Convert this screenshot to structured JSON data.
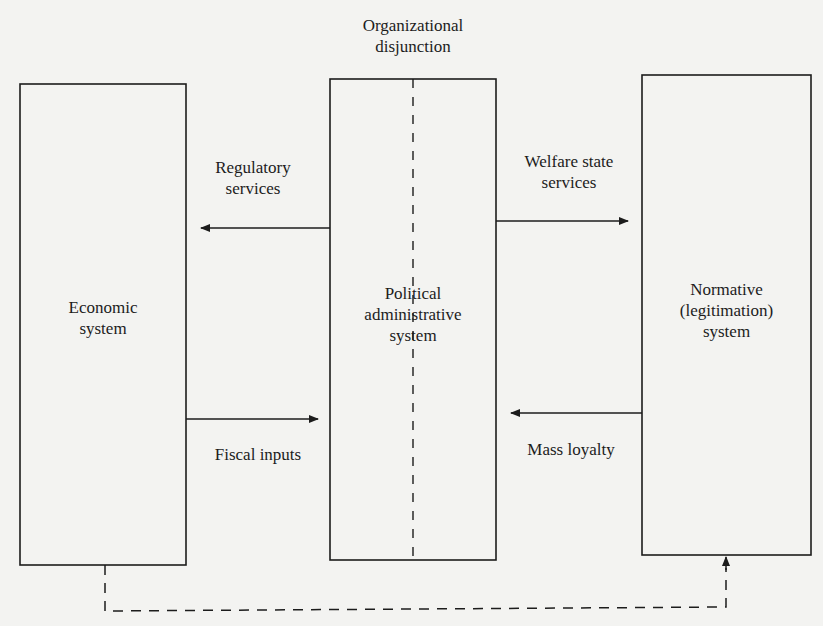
{
  "diagram": {
    "type": "flow",
    "heading": {
      "line1": "Organizational",
      "line2": "disjunction"
    },
    "nodes": [
      {
        "id": "economic",
        "line1": "Economic",
        "line2": "system",
        "line3": ""
      },
      {
        "id": "political",
        "line1": "Political",
        "line2": "administrative",
        "line3": "system"
      },
      {
        "id": "normative",
        "line1": "Normative",
        "line2": "(legitimation)",
        "line3": "system"
      }
    ],
    "edges": [
      {
        "from": "political",
        "to": "economic",
        "line1": "Regulatory",
        "line2": "services"
      },
      {
        "from": "political",
        "to": "normative",
        "line1": "Welfare state",
        "line2": "services"
      },
      {
        "from": "economic",
        "to": "political",
        "line1": "Fiscal inputs",
        "line2": ""
      },
      {
        "from": "normative",
        "to": "political",
        "line1": "Mass loyalty",
        "line2": ""
      },
      {
        "from": "economic",
        "to": "normative",
        "style": "dashed",
        "line1": "",
        "line2": ""
      }
    ],
    "colors": {
      "background": "#f3f3f1",
      "stroke": "#1c1c1c"
    }
  }
}
